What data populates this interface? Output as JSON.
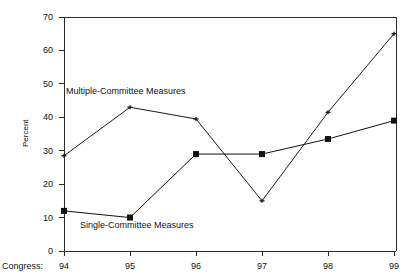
{
  "chart_data": {
    "type": "line",
    "title": "",
    "subtitle": "",
    "xlabel": "Congress:",
    "ylabel": "Percent",
    "categories": [
      "94",
      "95",
      "96",
      "97",
      "98",
      "99"
    ],
    "ylim": [
      0,
      70
    ],
    "yticks": [
      "0",
      "10",
      "20",
      "30",
      "40",
      "50",
      "60",
      "70"
    ],
    "grid": false,
    "legend_position": "inline-annotation",
    "series": [
      {
        "name": "Multiple-Committee Measures",
        "marker": "small-cross",
        "color": "#1a1a1a",
        "values": [
          28.5,
          43,
          39.5,
          15,
          41.5,
          65
        ]
      },
      {
        "name": "Single-Committee Measures",
        "marker": "filled-square",
        "color": "#111111",
        "values": [
          12,
          10,
          29,
          29,
          33.5,
          39
        ]
      }
    ],
    "annotations": [
      {
        "text": "Multiple-Committee Measures",
        "x": 66,
        "y": 87
      },
      {
        "text": "Single-Committee Measures",
        "x": 80,
        "y": 221
      }
    ]
  },
  "axes": {
    "y_title": "Percent",
    "x_title": "Congress:",
    "y_tick_labels": [
      "70",
      "60",
      "50",
      "40",
      "30",
      "20",
      "10",
      "0"
    ],
    "x_tick_labels": [
      "94",
      "95",
      "96",
      "97",
      "98",
      "99"
    ]
  },
  "colors": {
    "background": "#ffffff",
    "axis": "#2b2b2b",
    "line": "#2b2b2b",
    "text": "#111111"
  }
}
